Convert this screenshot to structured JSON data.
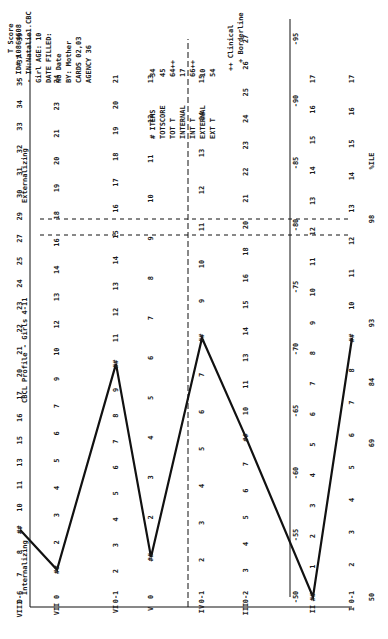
{
  "chart_data": {
    "type": "line",
    "title": "CBCL Profile - Girls 4-11",
    "group_labels": [
      "Internalizing",
      "Externalizing"
    ],
    "xlabel": "Syndrome scale",
    "ylabel": "T Score",
    "ylim": [
      50,
      100
    ],
    "percentile_axis": {
      "label": "%ILE",
      "ticks": [
        "98",
        "93",
        "84",
        "69",
        "50"
      ]
    },
    "t_score_ticks": [
      "95",
      "90",
      "85",
      "80",
      "75",
      "70",
      "65",
      "60",
      "55",
      "50"
    ],
    "categories": [
      "I",
      "II",
      "III",
      "IV",
      "V",
      "VI",
      "VII",
      "VIII"
    ],
    "series": [
      {
        "name": "Raw score marker (##)",
        "values": [
          9,
          0,
          8,
          8,
          1,
          10,
          1,
          9
        ]
      }
    ],
    "columns": [
      {
        "label": "I",
        "values": [
          "17",
          "16",
          "15",
          "14",
          "13",
          "12",
          "11",
          "10",
          "##",
          "8",
          "7",
          "6",
          "5",
          "4",
          "3",
          "2",
          "0-1"
        ]
      },
      {
        "label": "II",
        "values": [
          "17",
          "16",
          "15",
          "14",
          "13",
          "12",
          "11",
          "10",
          "9",
          "8",
          "7",
          "6",
          "5",
          "4",
          "3",
          "2",
          "1",
          "##"
        ]
      },
      {
        "label": "III",
        "values": [
          "27",
          "26",
          "25",
          "24",
          "23",
          "22",
          "21",
          "20",
          "18",
          "16",
          "15",
          "14",
          "13",
          "11",
          "10",
          "##",
          "7",
          "6",
          "5",
          "4",
          "3",
          "0-2"
        ]
      },
      {
        "label": "IV",
        "values": [
          "15",
          "14",
          "13",
          "12",
          "11",
          "10",
          "9",
          "##",
          "7",
          "6",
          "5",
          "4",
          "3",
          "2",
          "0-1"
        ]
      },
      {
        "label": "V",
        "values": [
          "13",
          "12",
          "11",
          "10",
          "9",
          "8",
          "7",
          "6",
          "5",
          "4",
          "3",
          "2",
          "##",
          "0"
        ]
      },
      {
        "label": "VI",
        "values": [
          "21",
          "20",
          "19",
          "18",
          "17",
          "16",
          "15",
          "14",
          "13",
          "12",
          "11",
          "##",
          "9",
          "8",
          "7",
          "6",
          "5",
          "4",
          "3",
          "2",
          "0-1"
        ]
      },
      {
        "label": "VII",
        "values": [
          "24",
          "23",
          "21",
          "20",
          "19",
          "18",
          "16",
          "14",
          "13",
          "12",
          "10",
          "9",
          "7",
          "6",
          "5",
          "4",
          "3",
          "2",
          "##",
          "0"
        ]
      },
      {
        "label": "VIII",
        "values": [
          "39",
          "37",
          "35",
          "34",
          "33",
          "32",
          "31",
          "30",
          "29",
          "27",
          "25",
          "24",
          "23",
          "22",
          "21",
          "20",
          "17",
          "16",
          "15",
          "13",
          "11",
          "10",
          "##",
          "8",
          "7",
          "0-6"
        ]
      }
    ],
    "reference_lines": {
      "clinical_t": 70,
      "borderline_t": 67
    },
    "grid": false,
    "legend_position": "right"
  },
  "header": {
    "t_score_label": "T Score",
    "id": "- ID# 10864608",
    "in_file": "- IN:Natalie1.CBC",
    "age": "Girl AGE: 10",
    "date_filled": "DATE FILLED:",
    "no_date": "No Date",
    "by": "BY: Mother",
    "cards": "CARDS 02,03",
    "agency": "AGENCY 36"
  },
  "summary": [
    {
      "label": "# ITEMS",
      "value": "34"
    },
    {
      "label": "TOTSCORE",
      "value": "45"
    },
    {
      "label": "TOT T",
      "value": "64++"
    },
    {
      "label": "INTERNAL",
      "value": "17"
    },
    {
      "label": "INT T",
      "value": "66++"
    },
    {
      "label": "EXTERNAL",
      "value": "10"
    },
    {
      "label": "EXT T",
      "value": "54"
    }
  ],
  "legend": {
    "clinical": "++ Clinical",
    "borderline": "+ Borderline"
  },
  "marker_symbol": "##"
}
